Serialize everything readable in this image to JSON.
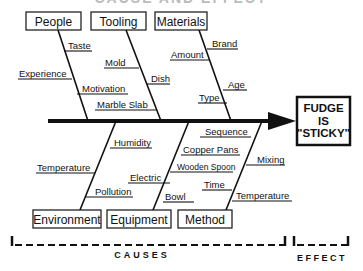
{
  "diagram": {
    "title": "CAUSE AND EFFECT",
    "effect": {
      "line1": "FUDGE",
      "line2": "IS",
      "line3": "\"STICKY\""
    },
    "categories": {
      "people": {
        "label": "People",
        "causes": [
          "Taste",
          "Experience",
          "Motivation"
        ]
      },
      "tooling": {
        "label": "Tooling",
        "causes": [
          "Mold",
          "Dish",
          "Marble Slab"
        ]
      },
      "materials": {
        "label": "Materials",
        "causes": [
          "Brand",
          "Amount",
          "Age",
          "Type"
        ]
      },
      "environment": {
        "label": "Environment",
        "causes": [
          "Humidity",
          "Temperature",
          "Pollution"
        ]
      },
      "equipment": {
        "label": "Equipment",
        "causes": [
          "Copper Pans",
          "Electric",
          "Wooden Spoon",
          "Bowl"
        ]
      },
      "method": {
        "label": "Method",
        "causes": [
          "Sequence",
          "Mixing",
          "Time",
          "Temperature"
        ]
      }
    },
    "footer": {
      "causes_label": "CAUSES",
      "effect_label": "EFFECT"
    }
  }
}
